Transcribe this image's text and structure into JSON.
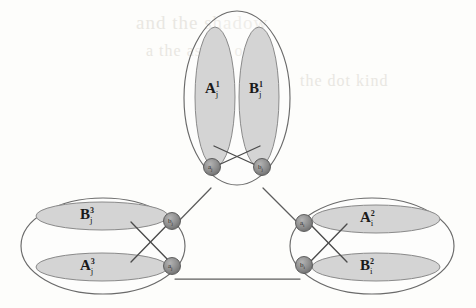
{
  "figure": {
    "kind": "graph-diagram",
    "background_color": "#fdfdfb",
    "ink_color": "#4a4a4a",
    "shade_color": "#d2d2d2",
    "node_color": "#8c8c8c",
    "clusters": [
      {
        "id": "top",
        "orientation": "vertical",
        "inner_sets": [
          {
            "id": "top-left-set",
            "base": "A",
            "sup": "1",
            "sub": "j"
          },
          {
            "id": "top-right-set",
            "base": "B",
            "sup": "1",
            "sub": "j"
          }
        ],
        "nodes": [
          {
            "id": "top-node-a",
            "base": "a",
            "sub": "j"
          },
          {
            "id": "top-node-b",
            "base": "b",
            "sub": "j"
          }
        ]
      },
      {
        "id": "left",
        "orientation": "horizontal",
        "inner_sets": [
          {
            "id": "left-top-set",
            "base": "B",
            "sup": "3",
            "sub": "j"
          },
          {
            "id": "left-bottom-set",
            "base": "A",
            "sup": "3",
            "sub": "j"
          }
        ],
        "nodes": [
          {
            "id": "left-node-b",
            "base": "b",
            "sub": "j"
          },
          {
            "id": "left-node-a",
            "base": "a",
            "sub": "j"
          }
        ]
      },
      {
        "id": "right",
        "orientation": "horizontal",
        "inner_sets": [
          {
            "id": "right-top-set",
            "base": "A",
            "sup": "2",
            "sub": "i"
          },
          {
            "id": "right-bottom-set",
            "base": "B",
            "sup": "2",
            "sub": "i"
          }
        ],
        "nodes": [
          {
            "id": "right-node-a",
            "base": "a",
            "sub": "i"
          },
          {
            "id": "right-node-b",
            "base": "b",
            "sub": "i"
          }
        ]
      }
    ]
  },
  "labels": {
    "top_left": {
      "base": "A",
      "sup": "1",
      "sub": "j"
    },
    "top_right": {
      "base": "B",
      "sup": "1",
      "sub": "j"
    },
    "left_top": {
      "base": "B",
      "sup": "3",
      "sub": "j"
    },
    "left_bottom": {
      "base": "A",
      "sup": "3",
      "sub": "j"
    },
    "right_top": {
      "base": "A",
      "sup": "2",
      "sub": "i"
    },
    "right_bottom": {
      "base": "B",
      "sup": "2",
      "sub": "i"
    }
  },
  "nodes": {
    "top_a": {
      "base": "a",
      "sub": "j"
    },
    "top_b": {
      "base": "b",
      "sub": "j"
    },
    "left_b": {
      "base": "b",
      "sub": "j"
    },
    "left_a": {
      "base": "a",
      "sub": "j"
    },
    "right_a": {
      "base": "a",
      "sub": "i"
    },
    "right_b": {
      "base": "b",
      "sub": "i"
    }
  },
  "ghost_text": {
    "line1": "and the shadow",
    "line2": "a the as  the oni",
    "line3": "the dot  kind"
  }
}
